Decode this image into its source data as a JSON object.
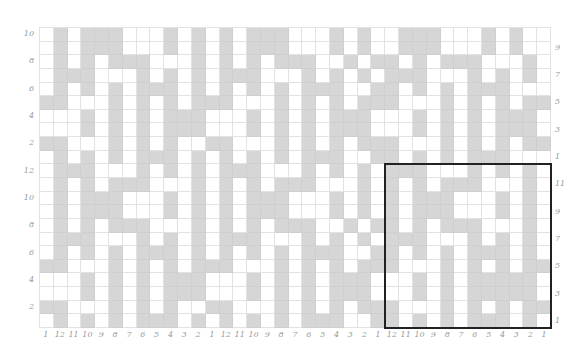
{
  "puzzle": {
    "columns": 37,
    "rows": 22,
    "column_labels": [
      "1",
      "12",
      "11",
      "10",
      "9",
      "8",
      "7",
      "6",
      "5",
      "4",
      "3",
      "2",
      "1",
      "12",
      "11",
      "10",
      "9",
      "8",
      "7",
      "6",
      "5",
      "4",
      "3",
      "2",
      "1",
      "12",
      "11",
      "10",
      "9",
      "8",
      "7",
      "6",
      "5",
      "4",
      "3",
      "2",
      "1"
    ],
    "left_labels": [
      {
        "row": 0,
        "text": "10"
      },
      {
        "row": 2,
        "text": "8"
      },
      {
        "row": 4,
        "text": "6"
      },
      {
        "row": 6,
        "text": "4"
      },
      {
        "row": 8,
        "text": "2"
      },
      {
        "row": 10,
        "text": "12"
      },
      {
        "row": 12,
        "text": "10"
      },
      {
        "row": 14,
        "text": "8"
      },
      {
        "row": 16,
        "text": "6"
      },
      {
        "row": 18,
        "text": "4"
      },
      {
        "row": 20,
        "text": "2"
      }
    ],
    "right_labels": [
      {
        "row": 1,
        "text": "9"
      },
      {
        "row": 3,
        "text": "7"
      },
      {
        "row": 5,
        "text": "5"
      },
      {
        "row": 7,
        "text": "3"
      },
      {
        "row": 9,
        "text": "1"
      },
      {
        "row": 11,
        "text": "11"
      },
      {
        "row": 13,
        "text": "9"
      },
      {
        "row": 15,
        "text": "7"
      },
      {
        "row": 17,
        "text": "5"
      },
      {
        "row": 19,
        "text": "3"
      },
      {
        "row": 21,
        "text": "1"
      }
    ],
    "highlight": {
      "col_start": 25,
      "col_end": 36,
      "row_start": 10,
      "row_end": 21
    },
    "colors": {
      "filled": "#d6d6d6",
      "empty": "#ffffff",
      "gridline": "#e2e2e2",
      "label": "#9a9a9a",
      "highlight": "#222222"
    },
    "cells": [
      "0101110001010101110001010011100010100",
      "0101110001010101110001010011100010100",
      "0101011100010101011100101101011100010",
      "0111000101010111000101010111000101010",
      "0101010111010101010111001101010111000",
      "1100010101011100010101011100010101011",
      "0001010101110001010101110001010101110",
      "0001010101110001010101110001010101110",
      "1100010101001100010101011100010101011",
      "0101010111010101010111001101010111000",
      "0111000101010111000101010111000101010",
      "0101011100010101011100010101011100010",
      "0101110001010101110001010101110001010",
      "0101110001010101110001010101110001010",
      "0101011100010101011100101101011100010",
      "0111000101010111000101010111000101010",
      "0101010111010101010111001101010111010",
      "1100010101011100010101011100010101011",
      "0001010101110001010101110001010111110",
      "0001010101110001010101110001010111110",
      "1100010101001100010101011100010101011",
      "0101010111010101010111001101010111010"
    ]
  }
}
